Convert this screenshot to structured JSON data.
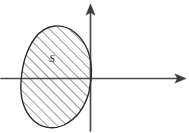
{
  "figure": {
    "background_color": "#ffffff",
    "width": 189,
    "height": 133,
    "ink_color": "#2b2b2b",
    "axis_color": "#4a4a4a"
  },
  "axes": {
    "origin": {
      "x": 90,
      "y": 78
    },
    "x_axis": {
      "name": "horizontal-axis",
      "label": "",
      "start": {
        "x": 1,
        "y": 78
      },
      "end": {
        "x": 186,
        "y": 78
      },
      "arrow_at": "right"
    },
    "y_axis": {
      "name": "vertical-axis",
      "label": "",
      "start": {
        "x": 90,
        "y": 131
      },
      "end": {
        "x": 90,
        "y": 4
      },
      "arrow_at": "top"
    }
  },
  "region": {
    "label": "S",
    "label_position": {
      "x": 52,
      "y": 62
    },
    "shape": "ellipse",
    "fill_style": "diagonal-hatching",
    "hatch_angle_degrees": 45,
    "hatch_spacing_px": 7,
    "center": {
      "x": 56,
      "y": 77
    },
    "radius_x": 35,
    "radius_y": 51,
    "rotation_degrees": -8,
    "outline_color": "#2b2b2b"
  }
}
